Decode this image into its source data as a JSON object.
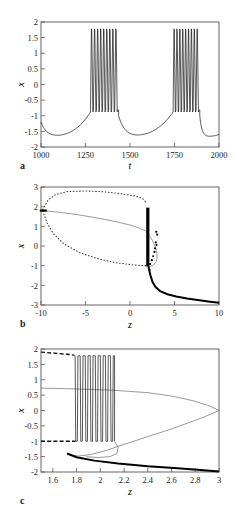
{
  "figure": {
    "panels": [
      "a",
      "b",
      "c"
    ],
    "label_a": "a",
    "label_b": "b",
    "label_c": "c"
  },
  "chart_data": [
    {
      "type": "line",
      "panel": "a",
      "title": "",
      "xlabel": "t",
      "ylabel": "x",
      "xlim": [
        1000,
        2000
      ],
      "ylim": [
        -2,
        2
      ],
      "xticks": [
        1000,
        1250,
        1500,
        1750,
        2000
      ],
      "xtick_labels": [
        "1000",
        "1250",
        "1500",
        "1750",
        "2000"
      ],
      "yticks": [
        -2,
        -1.5,
        -1,
        -0.5,
        0,
        0.5,
        1,
        1.5,
        2
      ],
      "ytick_labels": [
        "-2",
        "-1.5",
        "-1",
        "-0.5",
        "0",
        "0.5",
        "1",
        "1.5",
        "2"
      ],
      "grid": false,
      "legend": "none",
      "description": "Square-wave bursting time series: two bursts of fast spikes separated by quiescent periods",
      "series": [
        {
          "name": "x(t)",
          "style": "solid",
          "bursts": [
            {
              "start": 1278,
              "end": 1432,
              "n_spikes": 9,
              "spike_top": 1.78,
              "spike_bottom": -0.88
            },
            {
              "start": 1742,
              "end": 1888,
              "n_spikes": 9,
              "spike_top": 1.78,
              "spike_bottom": -0.88
            }
          ],
          "quiescent_min": -1.67,
          "quiescent_plateau": -1.6,
          "start_value": -1.2,
          "end_value": -1.6
        }
      ]
    },
    {
      "type": "line",
      "panel": "b",
      "title": "",
      "xlabel": "z",
      "ylabel": "x",
      "xlim": [
        -10,
        10
      ],
      "ylim": [
        -3,
        3
      ],
      "xticks": [
        -10,
        -5,
        0,
        5,
        10
      ],
      "xtick_labels": [
        "-10",
        "-5",
        "0",
        "5",
        "10"
      ],
      "yticks": [
        -3,
        -2,
        -1,
        0,
        1,
        2,
        3
      ],
      "ytick_labels": [
        "-3",
        "-2",
        "-1",
        "0",
        "1",
        "2",
        "3"
      ],
      "grid": false,
      "legend": "none",
      "description": "Bifurcation diagram of the fast subsystem versus slow variable z, with unstable limit-cycle envelope shown dotted and stable branches solid",
      "series": [
        {
          "name": "limit-cycle-envelope-upper",
          "style": "dotted",
          "points": [
            [
              -9.8,
              1.85
            ],
            [
              -9.2,
              2.35
            ],
            [
              -8.3,
              2.63
            ],
            [
              -7.0,
              2.77
            ],
            [
              -5.0,
              2.8
            ],
            [
              -3.0,
              2.76
            ],
            [
              -1.0,
              2.66
            ],
            [
              0.5,
              2.55
            ],
            [
              1.4,
              2.42
            ],
            [
              1.85,
              2.2
            ]
          ]
        },
        {
          "name": "limit-cycle-envelope-lower",
          "style": "dotted",
          "points": [
            [
              -9.8,
              1.78
            ],
            [
              -9.3,
              1.15
            ],
            [
              -8.6,
              0.62
            ],
            [
              -7.4,
              0.1
            ],
            [
              -5.6,
              -0.35
            ],
            [
              -3.6,
              -0.65
            ],
            [
              -1.6,
              -0.85
            ],
            [
              0.4,
              -0.96
            ],
            [
              1.5,
              -1.0
            ],
            [
              1.9,
              -1.0
            ]
          ]
        },
        {
          "name": "unstable-saddle-branch",
          "style": "thin-solid",
          "points": [
            [
              -9.8,
              1.8
            ],
            [
              -8.0,
              1.72
            ],
            [
              -6.0,
              1.6
            ],
            [
              -4.0,
              1.45
            ],
            [
              -2.0,
              1.28
            ],
            [
              0.0,
              1.07
            ],
            [
              1.0,
              0.92
            ],
            [
              1.7,
              0.78
            ],
            [
              2.1,
              0.6
            ],
            [
              2.5,
              0.3
            ],
            [
              2.8,
              0.0
            ],
            [
              3.0,
              -0.3
            ],
            [
              3.05,
              -0.6
            ],
            [
              2.9,
              -0.85
            ],
            [
              2.5,
              -1.0
            ],
            [
              2.1,
              -1.05
            ]
          ]
        },
        {
          "name": "stable-spiking-band",
          "style": "thick-vertical",
          "x": 2.0,
          "y_top": 1.95,
          "y_bottom": -1.05
        },
        {
          "name": "stable-rest-branch",
          "style": "thick-solid",
          "points": [
            [
              2.1,
              -1.1
            ],
            [
              2.3,
              -1.5
            ],
            [
              2.55,
              -1.85
            ],
            [
              2.9,
              -2.1
            ],
            [
              3.4,
              -2.3
            ],
            [
              4.2,
              -2.45
            ],
            [
              5.2,
              -2.57
            ],
            [
              6.4,
              -2.67
            ],
            [
              7.8,
              -2.76
            ],
            [
              9.0,
              -2.83
            ],
            [
              10,
              -2.88
            ]
          ]
        },
        {
          "name": "trajectory-marker-left",
          "style": "marker",
          "x": -9.8,
          "y": 1.8
        }
      ]
    },
    {
      "type": "line",
      "panel": "c",
      "title": "",
      "xlabel": "z",
      "ylabel": "x",
      "xlim": [
        1.5,
        3.0
      ],
      "ylim": [
        -2,
        2
      ],
      "xticks": [
        1.6,
        1.8,
        2.0,
        2.2,
        2.4,
        2.6,
        2.8,
        3.0
      ],
      "xtick_labels": [
        "1.6",
        "1.8",
        "2",
        "2.2",
        "2.4",
        "2.6",
        "2.8",
        "3"
      ],
      "yticks": [
        -2,
        -1.5,
        -1,
        -0.5,
        0,
        0.5,
        1,
        1.5,
        2
      ],
      "ytick_labels": [
        "-2",
        "-1.5",
        "-1",
        "-0.5",
        "0",
        "0.5",
        "1",
        "1.5",
        "2"
      ],
      "grid": false,
      "legend": "none",
      "description": "Magnified bifurcation diagram showing the burst trajectory oscillating between upper and lower branches, with the S-shaped nullcline folding at z = 3",
      "series": [
        {
          "name": "upper-envelope-dashed",
          "style": "dashed",
          "points": [
            [
              1.5,
              1.9
            ],
            [
              1.62,
              1.86
            ],
            [
              1.72,
              1.83
            ],
            [
              1.78,
              1.8
            ]
          ]
        },
        {
          "name": "lower-envelope-dashed",
          "style": "dashed",
          "points": [
            [
              1.5,
              -1.0
            ],
            [
              1.65,
              -1.0
            ],
            [
              1.75,
              -1.0
            ],
            [
              1.79,
              -1.0
            ]
          ]
        },
        {
          "name": "burst-oscillation",
          "style": "solid",
          "z_start": 1.78,
          "z_end": 2.12,
          "n_oscillations": 8,
          "top": 1.78,
          "bottom": -1.0
        },
        {
          "name": "unstable-middle-branch",
          "style": "thin-solid",
          "points": [
            [
              1.5,
              0.73
            ],
            [
              1.8,
              0.7
            ],
            [
              2.1,
              0.66
            ],
            [
              2.4,
              0.58
            ],
            [
              2.6,
              0.47
            ],
            [
              2.78,
              0.32
            ],
            [
              2.92,
              0.15
            ],
            [
              3.0,
              0.0
            ]
          ]
        },
        {
          "name": "saddle-node-branch",
          "style": "thin-solid",
          "points": [
            [
              3.0,
              0.0
            ],
            [
              2.85,
              -0.25
            ],
            [
              2.6,
              -0.6
            ],
            [
              2.4,
              -0.85
            ],
            [
              2.2,
              -1.1
            ],
            [
              2.05,
              -1.3
            ],
            [
              1.92,
              -1.43
            ],
            [
              1.82,
              -1.48
            ],
            [
              1.75,
              -1.46
            ],
            [
              1.72,
              -1.4
            ]
          ]
        },
        {
          "name": "stable-rest-branch",
          "style": "thick-solid",
          "points": [
            [
              1.72,
              -1.4
            ],
            [
              1.8,
              -1.52
            ],
            [
              1.95,
              -1.63
            ],
            [
              2.15,
              -1.72
            ],
            [
              2.4,
              -1.81
            ],
            [
              2.62,
              -1.87
            ],
            [
              2.82,
              -1.93
            ],
            [
              3.0,
              -1.98
            ]
          ]
        },
        {
          "name": "loop-return",
          "style": "thin-solid",
          "points": [
            [
              2.12,
              -1.0
            ],
            [
              2.15,
              -1.2
            ],
            [
              2.14,
              -1.4
            ],
            [
              2.08,
              -1.5
            ],
            [
              1.98,
              -1.53
            ],
            [
              1.88,
              -1.5
            ]
          ]
        }
      ]
    }
  ]
}
